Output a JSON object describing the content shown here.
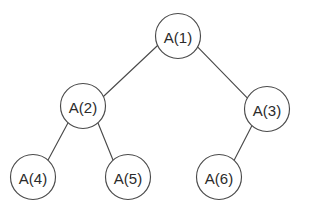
{
  "diagram": {
    "type": "binary-tree",
    "background_color": "#ffffff",
    "stroke_color": "#4a4a4a",
    "text_color": "#2b2b2b",
    "node_radius": 22.5,
    "nodes": [
      {
        "id": "n1",
        "label": "A(1)",
        "cx": 178,
        "cy": 36,
        "level": 0
      },
      {
        "id": "n2",
        "label": "A(2)",
        "cx": 83,
        "cy": 106,
        "level": 1
      },
      {
        "id": "n3",
        "label": "A(3)",
        "cx": 267,
        "cy": 109,
        "level": 1
      },
      {
        "id": "n4",
        "label": "A(4)",
        "cx": 33,
        "cy": 177,
        "level": 2
      },
      {
        "id": "n5",
        "label": "A(5)",
        "cx": 128,
        "cy": 177,
        "level": 2
      },
      {
        "id": "n6",
        "label": "A(6)",
        "cx": 219,
        "cy": 177,
        "level": 2
      }
    ],
    "edges": [
      {
        "id": "e1",
        "from": "n1",
        "to": "n2",
        "x1": 157.6,
        "y1": 45.5,
        "x2": 103.4,
        "y2": 96.5
      },
      {
        "id": "e2",
        "from": "n1",
        "to": "n3",
        "x1": 197.8,
        "y1": 47.2,
        "x2": 247.2,
        "y2": 97.8
      },
      {
        "id": "e3",
        "from": "n2",
        "to": "n4",
        "x1": 68.2,
        "y1": 122.5,
        "x2": 47.8,
        "y2": 160.5
      },
      {
        "id": "e4",
        "from": "n2",
        "to": "n5",
        "x1": 97.8,
        "y1": 122.5,
        "x2": 113.2,
        "y2": 160.5
      },
      {
        "id": "e5",
        "from": "n3",
        "to": "n6",
        "x1": 252.0,
        "y1": 125.5,
        "x2": 234.0,
        "y2": 160.5
      }
    ]
  }
}
